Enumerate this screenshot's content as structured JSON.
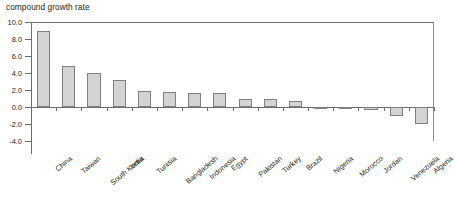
{
  "chart": {
    "title": "compound growth rate"
  },
  "chart_data": {
    "type": "bar",
    "title": "compound growth rate",
    "xlabel": "",
    "ylabel": "",
    "ylim": [
      -4.0,
      10.0
    ],
    "ytick_values": [
      10.0,
      8.0,
      6.0,
      4.0,
      2.0,
      0.0,
      -2.0,
      -4.0
    ],
    "ytick_labels": [
      "10.0",
      "8.0",
      "6.0",
      "4.0",
      "2.0",
      "0.0",
      "-2.0",
      "-4.0"
    ],
    "grid": false,
    "legend": "none",
    "categories": [
      "China",
      "Taiwan",
      "South Korea",
      "India",
      "Tunisia",
      "Bangladesh",
      "Indonesia",
      "Egypt",
      "Pakistan",
      "Turkey",
      "Brazil",
      "Nigeria",
      "Morocco",
      "Jordan",
      "Venezuela",
      "Algeria"
    ],
    "values": [
      8.9,
      4.8,
      4.0,
      3.2,
      1.9,
      1.8,
      1.7,
      1.6,
      1.0,
      0.9,
      0.7,
      -0.1,
      -0.2,
      -0.4,
      -1.0,
      -2.0
    ],
    "bar_color": "#d3d3d3",
    "bar_edge_color": "#808080"
  }
}
